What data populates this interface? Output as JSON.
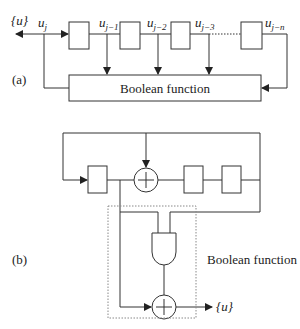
{
  "figure": {
    "part_a": {
      "label": "(a)",
      "output_label": "{u}",
      "taps": [
        {
          "symbol": "u",
          "subscript": "j"
        },
        {
          "symbol": "u",
          "subscript": "j−1"
        },
        {
          "symbol": "u",
          "subscript": "j−2"
        },
        {
          "symbol": "u",
          "subscript": "j−3"
        },
        {
          "symbol": "u",
          "subscript": "j−n"
        }
      ],
      "function_box_label": "Boolean function"
    },
    "part_b": {
      "label": "(b)",
      "output_label": "{u}",
      "function_label": "Boolean function"
    }
  },
  "colors": {
    "line": "#333333",
    "dotted": "#888888",
    "background": "#ffffff"
  }
}
